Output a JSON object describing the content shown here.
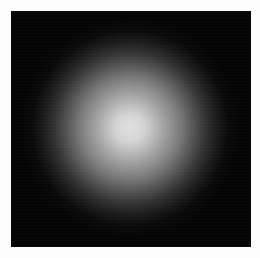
{
  "image": {
    "subject": "radial glow / blurred light spot on black background",
    "background_color": "#ffffff",
    "plate_color": "#050505",
    "glow_center_color": "#e2e2e2",
    "glow_center": [
      130,
      128
    ],
    "glow_radius_px": 98
  },
  "captions": {
    "top": "",
    "bottom": ""
  }
}
